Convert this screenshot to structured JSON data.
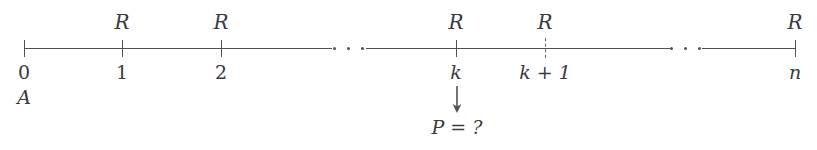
{
  "figure": {
    "background_color": "#ffffff",
    "line_color": "#50505a",
    "text_color": "#3a3a42"
  },
  "axis": {
    "y": 48,
    "x_start": 24,
    "x_end": 795,
    "segments": [
      {
        "x": 24,
        "width": 308
      },
      {
        "x": 366,
        "width": 304
      },
      {
        "x": 702,
        "width": 93
      }
    ]
  },
  "ticks": [
    {
      "id": "tick-0",
      "x": 24,
      "style": "solid",
      "label": "0",
      "label_italic": false
    },
    {
      "id": "tick-1",
      "x": 122,
      "style": "solid",
      "label": "1",
      "label_italic": false
    },
    {
      "id": "tick-2",
      "x": 221,
      "style": "solid",
      "label": "2",
      "label_italic": false
    },
    {
      "id": "tick-k",
      "x": 456,
      "style": "solid",
      "label": "k",
      "label_italic": true
    },
    {
      "id": "tick-k1",
      "x": 545,
      "style": "dashed",
      "label": "k + 1",
      "label_italic": true
    },
    {
      "id": "tick-n",
      "x": 795,
      "style": "solid",
      "label": "n",
      "label_italic": true
    }
  ],
  "ring_labels": [
    {
      "id": "ring-label-1",
      "x": 122,
      "text": "R"
    },
    {
      "id": "ring-label-2",
      "x": 221,
      "text": "R"
    },
    {
      "id": "ring-label-k",
      "x": 456,
      "text": "R"
    },
    {
      "id": "ring-label-k1",
      "x": 545,
      "text": "R"
    },
    {
      "id": "ring-label-n",
      "x": 795,
      "text": "R"
    }
  ],
  "ellipses": [
    {
      "id": "ellipsis-left",
      "x": 333,
      "width": 31
    },
    {
      "id": "ellipsis-right",
      "x": 670,
      "width": 31
    }
  ],
  "corner_label": {
    "text": "A",
    "x": 24,
    "y": 88
  },
  "annotation": {
    "arrow_glyph": "↓",
    "arrow_x": 457,
    "arrow_y": 86,
    "text": "P = ?",
    "text_x": 457,
    "text_y": 118
  }
}
